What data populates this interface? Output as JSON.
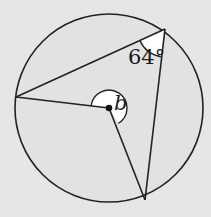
{
  "diagram": {
    "type": "circle-theorem",
    "background": "#e6e6e6",
    "circle_fill": "#e2e2e2",
    "stroke": "#222222",
    "highlight_fill": "#ffffff",
    "circle": {
      "cx": 109,
      "cy": 108,
      "r": 94
    },
    "center_point": {
      "x": 109,
      "y": 108
    },
    "points_on_circumference": [
      {
        "name": "left",
        "x": 16,
        "y": 97
      },
      {
        "name": "top-right",
        "x": 165,
        "y": 29
      },
      {
        "name": "bottom",
        "x": 145,
        "y": 200
      }
    ],
    "labels": {
      "inscribed_angle": "64°",
      "reflex_angle": "b"
    }
  }
}
